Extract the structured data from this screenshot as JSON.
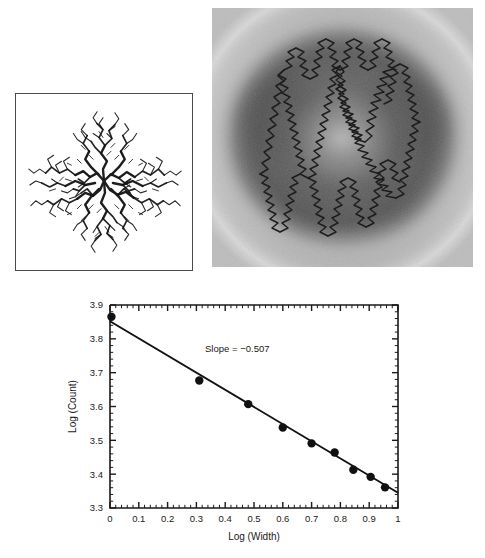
{
  "figure": {
    "panels": [
      {
        "id": "dla-cluster",
        "caption": "",
        "kind": "fractal-aggregate-image",
        "border": "#4a4a4a",
        "background": "#ffffff",
        "ink": "#111111"
      },
      {
        "id": "grayscale-fractal-field",
        "caption": "",
        "kind": "grayscale-field-image",
        "contour_color": "#111111",
        "background": "#8a8a8a"
      }
    ]
  },
  "chart_data": {
    "type": "scatter",
    "title": "",
    "xlabel": "Log (Width)",
    "ylabel": "Log (Count)",
    "xlim": [
      0,
      1
    ],
    "ylim": [
      3.3,
      3.9
    ],
    "xticks": [
      "0",
      "0.1",
      "0.2",
      "0.3",
      "0.4",
      "0.5",
      "0.6",
      "0.7",
      "0.8",
      "0.9",
      "1"
    ],
    "xtick_values": [
      0,
      0.1,
      0.2,
      0.3,
      0.4,
      0.5,
      0.6,
      0.7,
      0.8,
      0.9,
      1
    ],
    "yticks": [
      "3.3",
      "3.4",
      "3.5",
      "3.6",
      "3.7",
      "3.8",
      "3.9"
    ],
    "ytick_values": [
      3.3,
      3.4,
      3.5,
      3.6,
      3.7,
      3.8,
      3.9
    ],
    "minor_ticks_per_major": 5,
    "grid": false,
    "legend": null,
    "x": [
      0.005,
      0.31,
      0.48,
      0.6,
      0.7,
      0.78,
      0.845,
      0.905,
      0.955
    ],
    "y": [
      3.865,
      3.677,
      3.607,
      3.538,
      3.491,
      3.464,
      3.413,
      3.392,
      3.361
    ],
    "marker": "filled-circle",
    "marker_color": "#111111",
    "fit": {
      "slope": -0.507,
      "intercept": 3.852,
      "line_color": "#111111",
      "x_start": 0.0,
      "x_end": 1.0
    },
    "annotations": [
      {
        "text": "Slope = −0.507",
        "x": 0.33,
        "y": 3.762
      }
    ]
  }
}
